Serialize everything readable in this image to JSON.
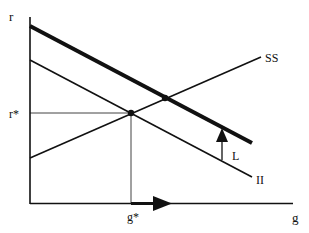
{
  "diagram": {
    "type": "economics-curve-diagram",
    "axes": {
      "y_label": "r",
      "x_label": "g",
      "y_marker_label": "r*",
      "x_marker_label": "g*"
    },
    "curves": [
      {
        "name": "SS",
        "label": "SS",
        "style": "thin",
        "slope": "upward"
      },
      {
        "name": "II",
        "label": "II",
        "style": "thin",
        "slope": "downward"
      },
      {
        "name": "II-shifted",
        "label": "",
        "style": "thick",
        "slope": "downward"
      }
    ],
    "shift_label": "L",
    "annotations": {
      "equilibrium_initial": "intersection of SS and II at (g*, r*)",
      "equilibrium_new": "intersection of SS and shifted II (thick)",
      "shift_arrow": "upward arrow labeled L from II to thick line",
      "g_arrow": "rightward arrow on g axis from g*"
    },
    "colors": {
      "line": "#111111",
      "background": "#ffffff"
    }
  }
}
